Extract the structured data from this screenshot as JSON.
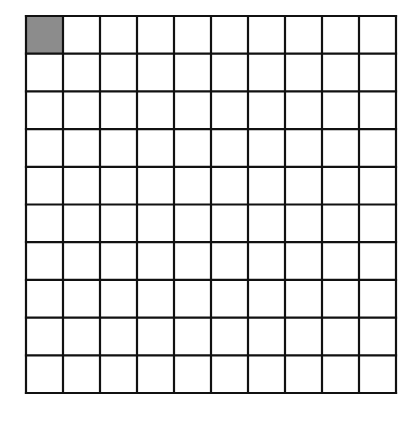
{
  "diagram": {
    "type": "hundred-grid",
    "rows": 10,
    "columns": 10,
    "total_cells": 100,
    "shaded_cells": [
      {
        "row": 0,
        "col": 0
      }
    ],
    "shaded_count": 1,
    "colors": {
      "background": "#ffffff",
      "line": "#111111",
      "shaded_fill": "#8c8c8c",
      "empty_fill": "#ffffff"
    },
    "geometry": {
      "left": 26,
      "top": 16,
      "right": 396,
      "bottom": 393,
      "line_width": 2.2
    }
  }
}
